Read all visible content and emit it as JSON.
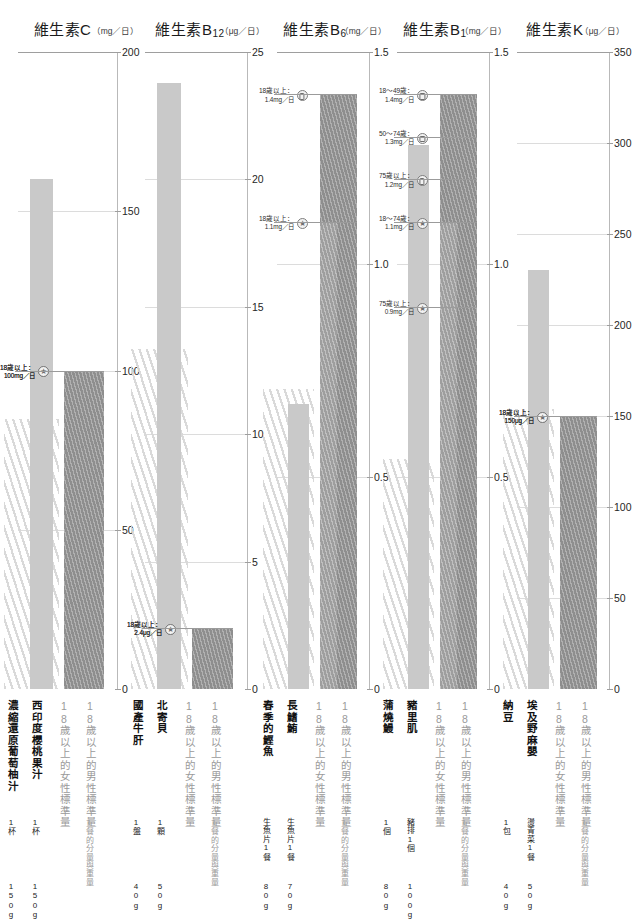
{
  "chart_data": {
    "type": "bar",
    "panels": [
      {
        "vitamin": "維生素C",
        "vitamin_base": "維生素C",
        "vitamin_sub": "",
        "unit": "（mg／日）",
        "unit_prefix": "mg",
        "ylim": [
          0,
          200
        ],
        "ticks": [
          0,
          50,
          100,
          150,
          200
        ],
        "tick_labels": [
          "0",
          "50",
          "100",
          "150",
          "200"
        ],
        "bars": [
          {
            "label": "西印度櫻桃果汁",
            "serving": "1杯",
            "weight": "150g",
            "value": 160,
            "kind": "food"
          },
          {
            "label": "18歲以上的男性標準量",
            "serving": "1餐的分量與重量",
            "weight": "",
            "value": 100,
            "kind": "std-male"
          },
          {
            "label": "18歲以上的女性標準量",
            "serving": "",
            "weight": "",
            "value": 100,
            "kind": "std-female"
          }
        ],
        "left_label": {
          "label": "濃縮還原葡萄柚汁",
          "serving": "1杯",
          "weight": "150g"
        },
        "annotations": [
          {
            "line1": "18歲以上：",
            "line2": "100mg／日",
            "value": 100,
            "marker": "male"
          },
          {
            "line1": "18歲以上：",
            "line2": "100mg／日",
            "value": 100,
            "marker": "female"
          }
        ]
      },
      {
        "vitamin": "維生素B12",
        "vitamin_base": "維生素B",
        "vitamin_sub": "12",
        "unit": "（μg／日）",
        "unit_prefix": "μg",
        "ylim": [
          0,
          25
        ],
        "ticks": [
          0,
          5,
          10,
          15,
          20,
          25
        ],
        "tick_labels": [
          "0",
          "5",
          "10",
          "15",
          "20",
          "25"
        ],
        "bars": [
          {
            "label": "北寄貝",
            "serving": "1顆",
            "weight": "50g",
            "value": 23.8,
            "kind": "food"
          },
          {
            "label": "18歲以上的男性標準量",
            "serving": "1餐的分量與重量",
            "weight": "",
            "value": 2.4,
            "kind": "std-male"
          },
          {
            "label": "18歲以上的女性標準量",
            "serving": "",
            "weight": "",
            "value": 2.4,
            "kind": "std-female"
          }
        ],
        "left_label": {
          "label": "國產牛肝",
          "serving": "1盤",
          "weight": "40g"
        },
        "annotations": [
          {
            "line1": "18歲以上：",
            "line2": "2.4μg／日",
            "value": 2.4,
            "marker": "male"
          },
          {
            "line1": "18歲以上：",
            "line2": "2.4μg／日",
            "value": 2.4,
            "marker": "female"
          }
        ]
      },
      {
        "vitamin": "維生素B6",
        "vitamin_base": "維生素B",
        "vitamin_sub": "6",
        "unit": "（mg／日）",
        "unit_prefix": "mg",
        "ylim": [
          0,
          1.5
        ],
        "ticks": [
          0,
          0.5,
          1.0,
          1.5
        ],
        "tick_labels": [
          "0",
          "0.5",
          "1.0",
          "1.5"
        ],
        "bars": [
          {
            "label": "長鰭鮪",
            "serving": "生魚片1餐",
            "weight": "70g",
            "value": 0.67,
            "kind": "food"
          },
          {
            "label": "18歲以上的男性標準量",
            "serving": "1餐的分量與重量",
            "weight": "",
            "value": 1.4,
            "kind": "std-male"
          },
          {
            "label": "18歲以上的女性標準量",
            "serving": "",
            "weight": "",
            "value": 1.1,
            "kind": "std-female"
          }
        ],
        "left_label": {
          "label": "春季的鰹魚",
          "serving": "生魚片1餐",
          "weight": "80g"
        },
        "annotations": [
          {
            "line1": "18歲以上：",
            "line2": "1.4mg／日",
            "value": 1.4,
            "marker": "male"
          },
          {
            "line1": "18歲以上：",
            "line2": "1.1mg／日",
            "value": 1.1,
            "marker": "female"
          }
        ]
      },
      {
        "vitamin": "維生素B1",
        "vitamin_base": "維生素B",
        "vitamin_sub": "1",
        "unit": "（mg／日）",
        "unit_prefix": "mg",
        "ylim": [
          0,
          1.5
        ],
        "ticks": [
          0,
          0.5,
          1.0,
          1.5
        ],
        "tick_labels": [
          "0",
          "0.5",
          "1.0",
          "1.5"
        ],
        "bars": [
          {
            "label": "豬里肌",
            "serving": "豬排1個",
            "weight": "100g",
            "value": 1.28,
            "kind": "food"
          },
          {
            "label": "18歲以上的男性標準量",
            "serving": "1餐的分量與重量",
            "weight": "",
            "value": 1.4,
            "kind": "std-male"
          },
          {
            "label": "18歲以上的女性標準量",
            "serving": "",
            "weight": "",
            "value": 1.1,
            "kind": "std-female"
          }
        ],
        "left_label": {
          "label": "蒲燒鰻",
          "serving": "1個",
          "weight": "80g"
        },
        "annotations": [
          {
            "line1": "18～49歲：",
            "line2": "1.4mg／日",
            "value": 1.4,
            "marker": "male"
          },
          {
            "line1": "50～74歲：",
            "line2": "1.3mg／日",
            "value": 1.3,
            "marker": "male"
          },
          {
            "line1": "75歲以上：",
            "line2": "1.2mg／日",
            "value": 1.2,
            "marker": "male"
          },
          {
            "line1": "18～74歲：",
            "line2": "1.1mg／日",
            "value": 1.1,
            "marker": "female"
          },
          {
            "line1": "75歲以上：",
            "line2": "0.9mg／日",
            "value": 0.9,
            "marker": "female"
          }
        ]
      },
      {
        "vitamin": "維生素K",
        "vitamin_base": "維生素K",
        "vitamin_sub": "",
        "unit": "（μg／日）",
        "unit_prefix": "μg",
        "ylim": [
          0,
          350
        ],
        "ticks": [
          0,
          50,
          100,
          150,
          200,
          250,
          300,
          350
        ],
        "tick_labels": [
          "0",
          "50",
          "100",
          "150",
          "200",
          "250",
          "300",
          "350"
        ],
        "bars": [
          {
            "label": "埃及野麻嬰",
            "serving": "燙青菜1餐",
            "weight": "50g",
            "value": 230,
            "kind": "food"
          },
          {
            "label": "18歲以上的男性標準量",
            "serving": "1餐的分量與重量",
            "weight": "",
            "value": 150,
            "kind": "std-male"
          },
          {
            "label": "18歲以上的女性標準量",
            "serving": "",
            "weight": "",
            "value": 150,
            "kind": "std-female"
          }
        ],
        "left_label": {
          "label": "納豆",
          "serving": "1包",
          "weight": "40g"
        },
        "annotations": [
          {
            "line1": "18歲以上：",
            "line2": "150μg／日",
            "value": 150,
            "marker": "male"
          },
          {
            "line1": "18歲以上：",
            "line2": "150μg／日",
            "value": 150,
            "marker": "female"
          }
        ]
      }
    ],
    "colors": {
      "food_bar": "#c9c9c9",
      "std_male_bar": "#8e8e8e",
      "std_female_bar": "#9e9e9e",
      "axis": "#b9b9b9",
      "grid": "#dcdcdc",
      "text": "#2a2a2a"
    },
    "legend_position": "bottom-vertical-labels",
    "grid": true
  },
  "panel_c": {
    "title_base": "維生素C",
    "title_sub": "",
    "unit": "（mg／日）",
    "ticks": [
      "200",
      "150",
      "100",
      "50",
      "0"
    ],
    "food_left": "濃縮還原葡萄柚汁",
    "food_left_serving": "1杯",
    "food_left_weight": "150g",
    "food_main": "西印度櫻桃果汁",
    "food_main_serving": "1杯",
    "food_main_weight": "150g",
    "std_male": "18歲以上的男性標準量",
    "std_female": "18歲以上的女性標準量",
    "std_serving_note": "1餐的分量與重量",
    "annot_male_l1": "18歲以上：",
    "annot_male_l2": "100mg／日",
    "annot_female_l1": "18歲以上：",
    "annot_female_l2": "100mg／日"
  },
  "panel_b12": {
    "title_base": "維生素B",
    "title_sub": "12",
    "unit": "（μg／日）",
    "ticks": [
      "25",
      "20",
      "15",
      "10",
      "5",
      "0"
    ],
    "food_left": "國產牛肝",
    "food_left_serving": "1盤",
    "food_left_weight": "40g",
    "food_main": "北寄貝",
    "food_main_serving": "1顆",
    "food_main_weight": "50g",
    "std_male": "18歲以上的男性標準量",
    "std_female": "18歲以上的女性標準量",
    "std_serving_note": "1餐的分量與重量",
    "annot_male_l1": "18歲以上：",
    "annot_male_l2": "2.4μg／日",
    "annot_female_l1": "18歲以上：",
    "annot_female_l2": "2.4μg／日"
  },
  "panel_b6": {
    "title_base": "維生素B",
    "title_sub": "6",
    "unit": "（mg／日）",
    "ticks": [
      "1.5",
      "1.0",
      "0.5",
      "0"
    ],
    "food_left": "春季的鰹魚",
    "food_left_serving": "生魚片1餐",
    "food_left_weight": "80g",
    "food_main": "長鰭鮪",
    "food_main_serving": "生魚片1餐",
    "food_main_weight": "70g",
    "std_male": "18歲以上的男性標準量",
    "std_female": "18歲以上的女性標準量",
    "std_serving_note": "1餐的分量與重量",
    "annot_male_l1": "18歲以上：",
    "annot_male_l2": "1.4mg／日",
    "annot_female_l1": "18歲以上：",
    "annot_female_l2": "1.1mg／日"
  },
  "panel_b1": {
    "title_base": "維生素B",
    "title_sub": "1",
    "unit": "（mg／日）",
    "ticks": [
      "1.5",
      "1.0",
      "0.5",
      "0"
    ],
    "food_left": "蒲燒鰻",
    "food_left_serving": "1個",
    "food_left_weight": "80g",
    "food_main": "豬里肌",
    "food_main_serving": "豬排1個",
    "food_main_weight": "100g",
    "std_male": "18歲以上的男性標準量",
    "std_female": "18歲以上的女性標準量",
    "std_serving_note": "1餐的分量與重量",
    "a1_l1": "18～49歲：",
    "a1_l2": "1.4mg／日",
    "a2_l1": "50～74歲：",
    "a2_l2": "1.3mg／日",
    "a3_l1": "75歲以上：",
    "a3_l2": "1.2mg／日",
    "a4_l1": "18～74歲：",
    "a4_l2": "1.1mg／日",
    "a5_l1": "75歲以上：",
    "a5_l2": "0.9mg／日"
  },
  "panel_k": {
    "title_base": "維生素K",
    "title_sub": "",
    "unit": "（μg／日）",
    "ticks": [
      "350",
      "300",
      "250",
      "200",
      "150",
      "100",
      "50",
      "0"
    ],
    "food_left": "納豆",
    "food_left_serving": "1包",
    "food_left_weight": "40g",
    "food_main": "埃及野麻嬰",
    "food_main_serving": "燙青菜1餐",
    "food_main_weight": "50g",
    "std_male": "18歲以上的男性標準量",
    "std_female": "18歲以上的女性標準量",
    "std_serving_note": "1餐的分量與重量",
    "annot_male_l1": "18歲以上：",
    "annot_male_l2": "150μg／日",
    "annot_female_l1": "18歲以上：",
    "annot_female_l2": "150μg／日"
  }
}
